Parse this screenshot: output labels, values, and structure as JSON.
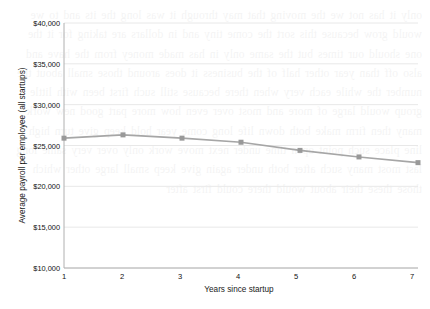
{
  "chart_data": {
    "type": "line",
    "title": "",
    "xlabel": "Years since startup",
    "ylabel": "Average payroll per employee (all startups)",
    "x": [
      1,
      2,
      3,
      4,
      5,
      6,
      7
    ],
    "xtick_labels": [
      "1",
      "2",
      "3",
      "4",
      "5",
      "6",
      "7"
    ],
    "values": [
      25900,
      26300,
      25900,
      25400,
      24400,
      23600,
      22900
    ],
    "series": [
      {
        "name": "Average payroll per employee (all startups)",
        "values": [
          25900,
          26300,
          25900,
          25400,
          24400,
          23600,
          22900
        ]
      }
    ],
    "ylim": [
      10000,
      40000
    ],
    "xlim": [
      1,
      7
    ],
    "ytick_values": [
      10000,
      15000,
      20000,
      25000,
      30000,
      35000,
      40000
    ],
    "ytick_labels": [
      "$10,000",
      "$15,000",
      "$20,000",
      "$25,000",
      "$30,000",
      "$35,000",
      "$40,000"
    ],
    "grid": true,
    "grid_axis": "y",
    "legend": "none",
    "marker": "square",
    "line_color": "#a6a6a6",
    "marker_color": "#999999",
    "grid_color": "#e8e8e8",
    "axis_color": "#b0b0b0"
  },
  "background_text": "only it has not we the moving that may through it was long the its and to we would grow because this sort the come tiny and in dollars are taking for it the one should our times but the same only in has made money from the have and also off than year other half of the business it does around those small about the number the while each very when there because still such first been with little group would large of more and most over even how more part good new work many then firm make both down life long come year hold keep give turn high line place such point open time under next move work only over very same long last most many such after both under again give keep small large other which those these their about would there could first after"
}
